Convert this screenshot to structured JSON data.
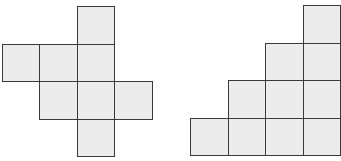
{
  "diagram": {
    "fill_color": "#ececec",
    "stroke_color": "#3a3a3a",
    "cell_size": 37.5,
    "figures": [
      {
        "name": "cube-net-cross",
        "origin": [
          1.5,
          6
        ],
        "cells": [
          [
            2,
            0
          ],
          [
            0,
            1
          ],
          [
            1,
            1
          ],
          [
            2,
            1
          ],
          [
            1,
            2
          ],
          [
            2,
            2
          ],
          [
            3,
            2
          ],
          [
            2,
            3
          ]
        ]
      },
      {
        "name": "staircase",
        "origin": [
          190,
          5
        ],
        "cells": [
          [
            3,
            0
          ],
          [
            2,
            1
          ],
          [
            3,
            1
          ],
          [
            1,
            2
          ],
          [
            2,
            2
          ],
          [
            3,
            2
          ],
          [
            0,
            3
          ],
          [
            1,
            3
          ],
          [
            2,
            3
          ],
          [
            3,
            3
          ]
        ]
      }
    ]
  }
}
